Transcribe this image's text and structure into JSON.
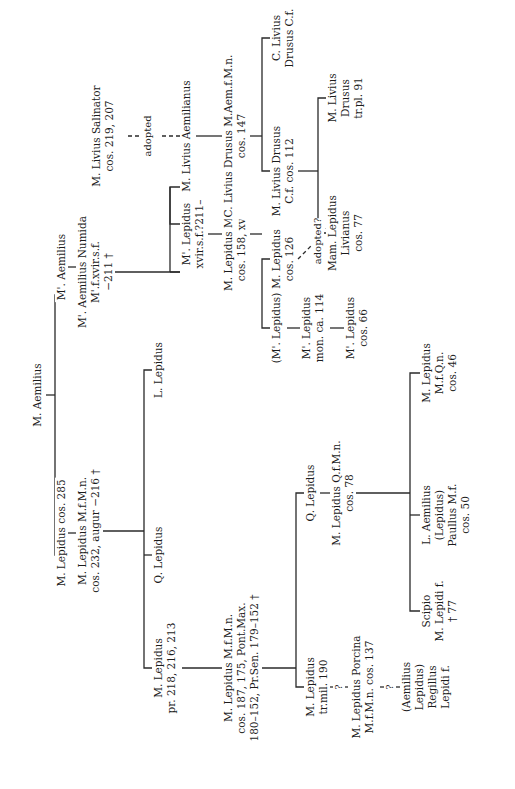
{
  "nodes": {
    "root": {
      "lines": [
        "M. Aemilius"
      ]
    },
    "m_lepidus_285": {
      "lines": [
        "M. Lepidus cos. 285"
      ]
    },
    "m_aemilius": {
      "lines": [
        "M'. Aemilius"
      ]
    },
    "m_lepidus_232": {
      "lines": [
        "M. Lepidus M.f.M.n.",
        "cos. 232, augur −216 †"
      ]
    },
    "m_aemilius_numida": {
      "lines": [
        "M'. Aemilius Numida",
        "M'.f.xvir.s.f.",
        "−211 †"
      ]
    },
    "m_livius_salinator": {
      "lines": [
        "M. Livius Salinator",
        "cos. 219, 207"
      ]
    },
    "m_lepidus_pr": {
      "lines": [
        "M. Lepidus",
        "pr. 218, 216, 213"
      ]
    },
    "q_lepidus_1": {
      "lines": [
        "Q. Lepidus"
      ]
    },
    "l_lepidus": {
      "lines": [
        "L. Lepidus"
      ]
    },
    "m_lepidus_xvir": {
      "lines": [
        "M'. Lepidus",
        "xvir.s.f.?211–"
      ]
    },
    "m_livius_aemilianus": {
      "lines": [
        "M. Livius Aemilianus"
      ]
    },
    "m_lepidus_187": {
      "lines": [
        "M. Lepidus M.f.M.n.",
        "cos. 187, 175, Pont.Max.",
        "180–152, Pr.Sen. 179–152 †"
      ]
    },
    "m_lepidus_158": {
      "lines": [
        "M. Lepidus M'.f.M'.n.",
        "cos. 158, xvir.s.f.–"
      ]
    },
    "c_livius_drusus_147": {
      "lines": [
        "C. Livius Drusus M.Aem.f.M.n.",
        "cos. 147"
      ]
    },
    "m_lepidus_trmil": {
      "lines": [
        "M. Lepidus",
        "tr.mil. 190"
      ]
    },
    "q_lepidus_2": {
      "lines": [
        "Q. Lepidus"
      ]
    },
    "m_lepidus_paren": {
      "lines": [
        "(M'. Lepidus)"
      ]
    },
    "m_lepidus_126": {
      "lines": [
        "M. Lepidus",
        "cos. 126"
      ]
    },
    "m_livius_drusus_112": {
      "lines": [
        "M. Livius Drusus",
        "C.f. cos. 112"
      ]
    },
    "c_livius_drusus_cf": {
      "lines": [
        "C. Livius",
        "Drusus C.f."
      ]
    },
    "m_lepidus_porcina": {
      "lines": [
        "M. Lepidus Porcina",
        "M.f.M.n. cos. 137"
      ]
    },
    "m_lepidus_qf": {
      "lines": [
        "M. Lepidus Q.f.M.n.",
        "cos. 78"
      ]
    },
    "m_lepidus_mon": {
      "lines": [
        "M'. Lepidus",
        "mon. ca. 114"
      ]
    },
    "mam_lepidus_livianus": {
      "lines": [
        "Mam. Lepidus",
        "Livianus",
        "cos. 77"
      ]
    },
    "m_livius_drusus_91": {
      "lines": [
        "M. Livius",
        "Drusus",
        "tr.pl. 91"
      ]
    },
    "aemilius_regillus": {
      "lines": [
        "(Aemilius",
        "Lepidus)",
        "Regillus",
        "Lepidi f."
      ]
    },
    "m_lepidus_66": {
      "lines": [
        "M'. Lepidus",
        "cos. 66"
      ]
    },
    "scipio": {
      "lines": [
        "Scipio",
        "M. Lepidi f.",
        "† 77"
      ]
    },
    "l_aemilius_paullus": {
      "lines": [
        "L. Aemilius",
        "(Lepidus)",
        "Paullus M.f.",
        "cos. 50"
      ]
    },
    "m_lepidus_46": {
      "lines": [
        "M. Lepidus",
        "M.f.Q.n.",
        "cos. 46"
      ]
    }
  },
  "notes": {
    "adopted": "adopted",
    "adopted_q": "adopted?",
    "q1": "?",
    "q2": "?"
  }
}
